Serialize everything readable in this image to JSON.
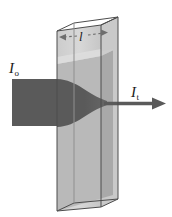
{
  "figure": {
    "type": "beer-lambert-absorption-diagram",
    "colors": {
      "beam": "#5a5a5a",
      "solution": "#b9b9b9",
      "solution_shade": "#a8a8a8",
      "solution_light": "#cfcfcf",
      "cuvette_glass": "#d9d9d9",
      "outline": "#4d4d4d",
      "label_text": "#1a1a1a",
      "background": "#ffffff"
    }
  },
  "labels": {
    "incident_intensity": {
      "symbol": "I",
      "subscript": "o",
      "meaning": "incident light intensity"
    },
    "transmitted_intensity": {
      "symbol": "I",
      "subscript": "t",
      "meaning": "transmitted light intensity"
    },
    "path_length": {
      "symbol": "l",
      "subscript": "",
      "meaning": "optical path length through the sample"
    }
  },
  "annotations": {
    "dimension_line": {
      "style": "dashed double-headed arrow",
      "label": "l"
    },
    "transmitted_arrow": {
      "style": "solid arrow pointing right",
      "label": "I t"
    }
  }
}
